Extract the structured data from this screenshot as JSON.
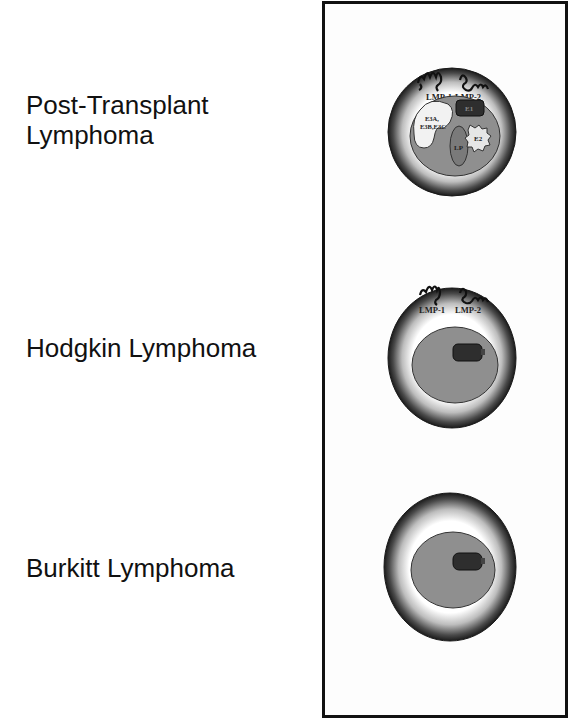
{
  "rows": [
    {
      "label_lines": [
        "Post-Transplant",
        "Lymphoma"
      ],
      "membrane_proteins": [
        "LMP-1",
        "LMP-2"
      ],
      "nuclear_antigens": [
        "E3A,",
        "E3B,E3C",
        "E1",
        "LP",
        "E2"
      ]
    },
    {
      "label_lines": [
        "Hodgkin Lymphoma"
      ],
      "membrane_proteins": [
        "LMP-1",
        "LMP-2"
      ],
      "nuclear_antigens": [
        "E1"
      ]
    },
    {
      "label_lines": [
        "Burkitt Lymphoma"
      ],
      "membrane_proteins": [],
      "nuclear_antigens": [
        "E1"
      ]
    }
  ],
  "colors": {
    "cell_rim": "#1a1a1a",
    "cytoplasm_center": "#ffffff",
    "nucleus": "#8f8f8f",
    "ebna1": "#2e2e2e",
    "ebna3": "#f2f2f2",
    "lp": "#7a7a7a",
    "e2": "#e6e6e6",
    "panel_border": "#111111"
  }
}
